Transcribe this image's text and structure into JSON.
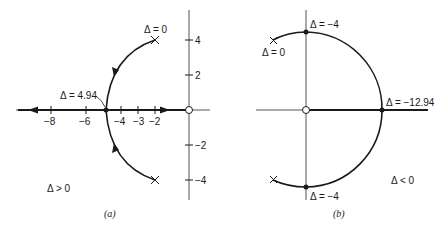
{
  "figure_a": {
    "caption": "(a)",
    "x_ticks": [
      "−8",
      "−6",
      "−4",
      "−3",
      "−2"
    ],
    "y_ticks": [
      "4",
      "2",
      "−2",
      "−4"
    ],
    "label_pole": "Δ = 0",
    "label_breakaway": "Δ = 4.94",
    "label_region": "Δ > 0"
  },
  "figure_b": {
    "caption": "(b)",
    "label_pole": "Δ = 0",
    "label_top_crossing": "Δ = −4",
    "label_bottom_crossing": "Δ = −4",
    "label_real_crossing": "Δ = −12.94",
    "label_region": "Δ < 0"
  },
  "colors": {
    "ink": "#1a1a1a",
    "axis": "#555555",
    "background": "#ffffff"
  }
}
